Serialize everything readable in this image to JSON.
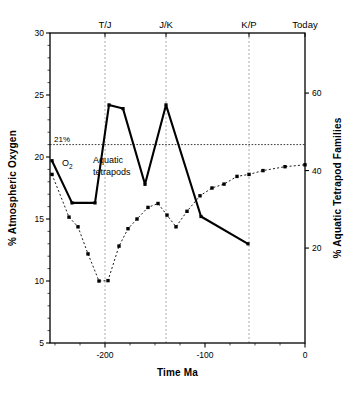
{
  "chart_data": {
    "type": "line",
    "title": "",
    "xlabel": "Time Ma",
    "ylabel": "% Atmospheric Oxygen",
    "y2label": "% Aquatic Tetrapod Families",
    "xlim": [
      -255,
      0
    ],
    "ylim": [
      5,
      30
    ],
    "y2lim": [
      -4.5,
      75.5
    ],
    "xticks": [
      -200,
      -100,
      0
    ],
    "xtick_labels": [
      "-200",
      "-100",
      "0"
    ],
    "yticks": [
      5,
      10,
      15,
      20,
      25,
      30
    ],
    "ytick_labels": [
      "5",
      "10",
      "15",
      "20",
      "25",
      "30"
    ],
    "y2ticks": [
      20,
      40,
      60
    ],
    "y2tick_labels": [
      "20",
      "40",
      "60"
    ],
    "grid": false,
    "legend_position": "inline-annotations",
    "reference_line": {
      "label": "21%",
      "value": 21,
      "style": "dotted",
      "axis": "left"
    },
    "event_markers": [
      {
        "label": "T/J",
        "x": -200
      },
      {
        "label": "J/K",
        "x": -139
      },
      {
        "label": "K/P",
        "x": -56
      },
      {
        "label": "Today",
        "x": 0
      }
    ],
    "series": [
      {
        "name": "O₂",
        "axis": "left",
        "style": "solid",
        "marker": "square",
        "annotation": "O₂",
        "points": [
          {
            "x": -253,
            "y": 19.7
          },
          {
            "x": -233,
            "y": 16.3
          },
          {
            "x": -210,
            "y": 16.3
          },
          {
            "x": -196,
            "y": 24.2
          },
          {
            "x": -182,
            "y": 23.9
          },
          {
            "x": -160,
            "y": 17.8
          },
          {
            "x": -139,
            "y": 24.2
          },
          {
            "x": -104,
            "y": 15.2
          },
          {
            "x": -57,
            "y": 13.0
          }
        ]
      },
      {
        "name": "Aquatic tetrapods",
        "axis": "right",
        "style": "dotted",
        "marker": "square",
        "annotation": "Aquatic\ntetrapods",
        "points": [
          {
            "x": -253,
            "y": 39.0
          },
          {
            "x": -236,
            "y": 28.0
          },
          {
            "x": -227,
            "y": 25.5
          },
          {
            "x": -217,
            "y": 18.5
          },
          {
            "x": -206,
            "y": 11.5
          },
          {
            "x": -197,
            "y": 11.6
          },
          {
            "x": -186,
            "y": 20.5
          },
          {
            "x": -177,
            "y": 25.0
          },
          {
            "x": -168,
            "y": 27.5
          },
          {
            "x": -157,
            "y": 30.5
          },
          {
            "x": -147,
            "y": 31.5
          },
          {
            "x": -138,
            "y": 28.5
          },
          {
            "x": -129,
            "y": 25.5
          },
          {
            "x": -118,
            "y": 29.5
          },
          {
            "x": -105,
            "y": 33.5
          },
          {
            "x": -93,
            "y": 35.5
          },
          {
            "x": -81,
            "y": 36.5
          },
          {
            "x": -68,
            "y": 38.5
          },
          {
            "x": -56,
            "y": 39.0
          },
          {
            "x": -42,
            "y": 40.0
          },
          {
            "x": -20,
            "y": 41.0
          },
          {
            "x": 0,
            "y": 41.5
          }
        ]
      }
    ]
  },
  "annotations": {
    "oxygen_label": "O",
    "oxygen_sub": "2",
    "aquatic_line1": "Aquatic",
    "aquatic_line2": "tetrapods",
    "percent_label": "21%"
  },
  "colors": {
    "line": "#000000",
    "axis": "#000000",
    "grid": "#888888",
    "background": "#ffffff"
  }
}
